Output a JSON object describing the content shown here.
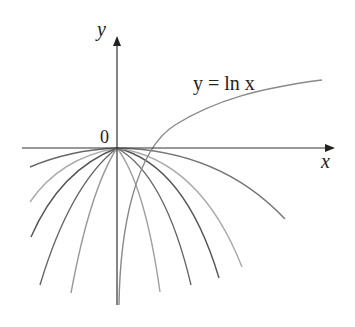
{
  "figure": {
    "axis_labels": {
      "y": "y",
      "x": "x",
      "origin": "0"
    },
    "curve_label": "y = ln x",
    "colors": {
      "axis": "#333333",
      "dark": "#555555",
      "mid": "#7a7a7a",
      "light": "#a8a8a8"
    }
  }
}
